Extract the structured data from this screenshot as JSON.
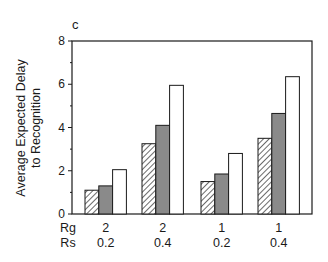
{
  "panel_label": "c",
  "chart_data": {
    "type": "bar",
    "title": "",
    "panel": "c",
    "xlabel": "",
    "ylabel": "Average Expected Delay to Recognition",
    "ylabel_lines": [
      "Average Expected Delay",
      "to Recognition"
    ],
    "ylim": [
      0,
      8
    ],
    "yticks": [
      0,
      2,
      4,
      6,
      8
    ],
    "yticks_minor": [
      1,
      3,
      5,
      7
    ],
    "grid": false,
    "legend": null,
    "row_labels": [
      "Rg",
      "Rs"
    ],
    "categories": [
      {
        "Rg": "2",
        "Rs": "0.2"
      },
      {
        "Rg": "2",
        "Rs": "0.4"
      },
      {
        "Rg": "1",
        "Rs": "0.2"
      },
      {
        "Rg": "1",
        "Rs": "0.4"
      }
    ],
    "series": [
      {
        "name": "hatched",
        "fill": "hatched",
        "values": [
          1.1,
          3.25,
          1.5,
          3.5
        ]
      },
      {
        "name": "grey",
        "fill": "#8a8a8a",
        "values": [
          1.3,
          4.1,
          1.85,
          4.65
        ]
      },
      {
        "name": "white",
        "fill": "#ffffff",
        "values": [
          2.05,
          5.95,
          2.8,
          6.35
        ]
      }
    ]
  }
}
